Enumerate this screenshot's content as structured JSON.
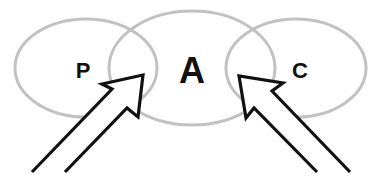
{
  "diagram": {
    "type": "overlapping-ellipses-with-arrows",
    "colors": {
      "background": "#ffffff",
      "ellipse_stroke": "#c2c2c2",
      "text": "#111111",
      "arrow_stroke": "#111111"
    },
    "ellipses": [
      {
        "id": "P",
        "label": "P",
        "cx": 86,
        "cy": 68,
        "rx": 71,
        "ry": 49
      },
      {
        "id": "A",
        "label": "A",
        "cx": 192,
        "cy": 68,
        "rx": 83,
        "ry": 57
      },
      {
        "id": "C",
        "label": "C",
        "cx": 296,
        "cy": 68,
        "rx": 70,
        "ry": 49
      }
    ],
    "labels": {
      "left": "P",
      "center": "A",
      "right": "C"
    },
    "arrows": [
      {
        "id": "left-arrow",
        "direction": "up-right",
        "target": "overlap P-A"
      },
      {
        "id": "right-arrow",
        "direction": "up-left",
        "target": "overlap A-C"
      }
    ]
  }
}
